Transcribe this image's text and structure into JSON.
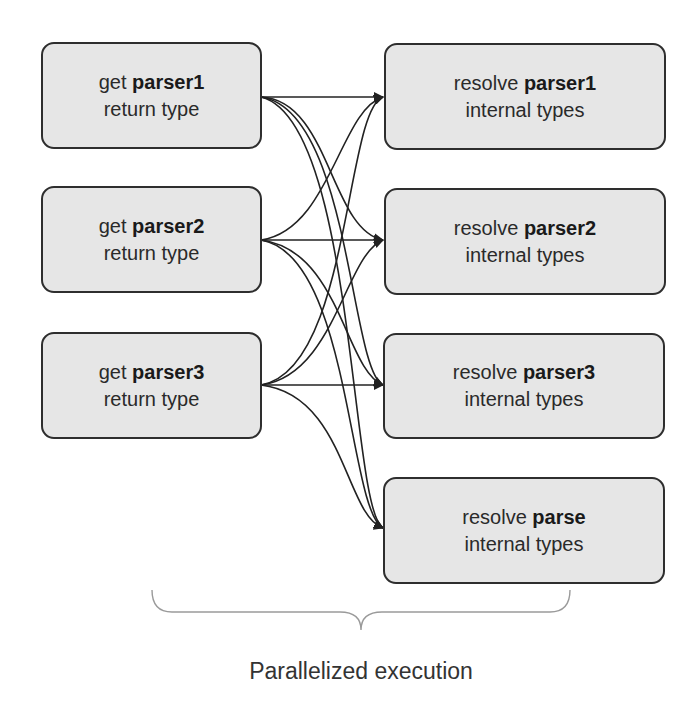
{
  "diagram": {
    "sources": [
      {
        "prefix": "get",
        "name": "parser1",
        "line2": "return type"
      },
      {
        "prefix": "get",
        "name": "parser2",
        "line2": "return type"
      },
      {
        "prefix": "get",
        "name": "parser3",
        "line2": "return type"
      }
    ],
    "targets": [
      {
        "prefix": "resolve",
        "name": "parser1",
        "line2": "internal types"
      },
      {
        "prefix": "resolve",
        "name": "parser2",
        "line2": "internal types"
      },
      {
        "prefix": "resolve",
        "name": "parser3",
        "line2": "internal types"
      },
      {
        "prefix": "resolve",
        "name": "parse",
        "line2": "internal types"
      }
    ],
    "edges": "every source connects to every target",
    "caption": "Parallelized execution"
  },
  "colors": {
    "node_fill": "#e6e6e6",
    "node_border": "#2e2e2e",
    "edge": "#222222",
    "brace": "#999999"
  }
}
